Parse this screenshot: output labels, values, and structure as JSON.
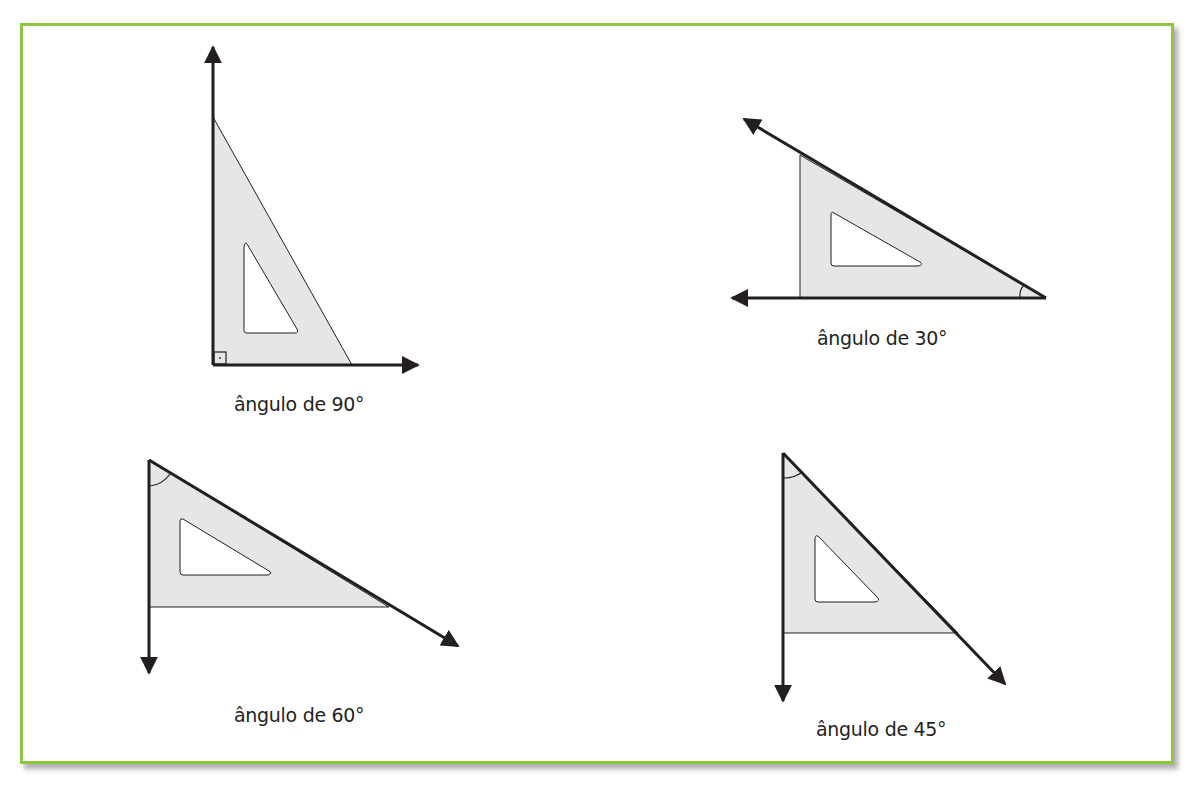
{
  "colors": {
    "frame_border": "#8cc63f",
    "ruler_fill": "#e6e6e6",
    "stroke": "#231f20",
    "background": "#ffffff"
  },
  "figures": [
    {
      "id": "angle-90",
      "label": "ângulo de 90°",
      "angle_deg": 90,
      "marker": "right-angle-square"
    },
    {
      "id": "angle-30",
      "label": "ângulo de 30°",
      "angle_deg": 30,
      "marker": "arc"
    },
    {
      "id": "angle-60",
      "label": "ângulo de 60°",
      "angle_deg": 60,
      "marker": "arc"
    },
    {
      "id": "angle-45",
      "label": "ângulo de 45°",
      "angle_deg": 45,
      "marker": "arc"
    }
  ]
}
